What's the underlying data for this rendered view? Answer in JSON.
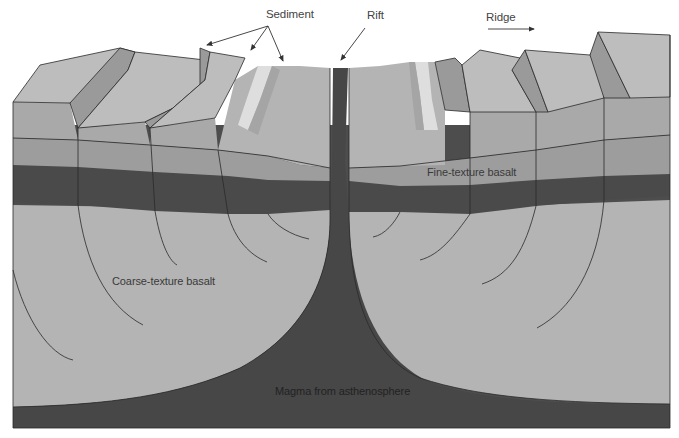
{
  "diagram": {
    "labels": {
      "sediment": "Sediment",
      "rift": "Rift",
      "ridge": "Ridge",
      "fine_basalt": "Fine-texture basalt",
      "coarse_basalt": "Coarse-texture basalt",
      "magma": "Magma from asthenosphere"
    },
    "colors": {
      "background": "#ffffff",
      "top_surface": "#bdbdbd",
      "scarp_face": "#9a9a9a",
      "layer_upper": "#a9a9a9",
      "layer_mid": "#9d9d9d",
      "dark_band": "#4a4a4a",
      "coarse_basalt": "#b4b4b4",
      "magma": "#4d4d4d",
      "sediment_light": "#dedede",
      "outline": "#2a2a2a"
    }
  }
}
